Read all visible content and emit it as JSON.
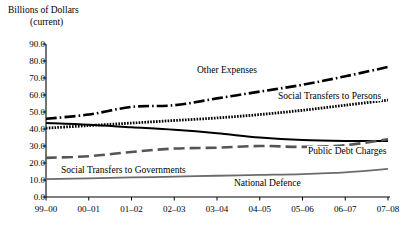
{
  "chart_data": {
    "type": "line",
    "title": "",
    "ylabel_lines": [
      "Billions of Dollars",
      "(current)"
    ],
    "ylabel": "Billions of Dollars (current)",
    "xlabel": "",
    "categories": [
      "99–00",
      "00–01",
      "01–02",
      "02–03",
      "03–04",
      "04–05",
      "05–06",
      "06–07",
      "07–08"
    ],
    "yticks": [
      "0.0",
      "10.0",
      "20.0",
      "30.0",
      "40.0",
      "50.0",
      "60.0",
      "70.0",
      "80.0",
      "90.0"
    ],
    "ylim": [
      0,
      90
    ],
    "grid": false,
    "legend_position": "inline-annotations",
    "series": [
      {
        "name": "Other Expenses",
        "style": "dash-dot",
        "color": "#000000",
        "label_x_category": "02–03",
        "values": [
          46.0,
          48.5,
          53.0,
          54.0,
          58.0,
          62.0,
          66.0,
          71.0,
          76.5
        ]
      },
      {
        "name": "Social Transfers to Persons",
        "style": "dotted-thick",
        "color": "#000000",
        "label_x_category": "05–06",
        "values": [
          40.5,
          42.0,
          43.5,
          45.0,
          46.5,
          48.5,
          51.0,
          54.0,
          57.0
        ]
      },
      {
        "name": "Public Debt Charges",
        "style": "solid",
        "color": "#000000",
        "label_x_category": "06–07",
        "values": [
          43.5,
          42.5,
          41.0,
          39.5,
          37.5,
          35.0,
          33.5,
          33.0,
          33.0
        ]
      },
      {
        "name": "Social Transfers to Governments",
        "style": "dashed",
        "color": "#555555",
        "label_x_category": "01–02",
        "values": [
          23.0,
          24.0,
          26.5,
          28.5,
          29.0,
          30.0,
          29.5,
          30.5,
          34.0
        ]
      },
      {
        "name": "National Defence",
        "style": "solid-gray",
        "color": "#6b6b6b",
        "label_x_category": "05–06",
        "values": [
          10.5,
          11.0,
          11.5,
          12.0,
          12.5,
          13.0,
          13.5,
          14.5,
          16.5
        ]
      }
    ]
  },
  "labels": {
    "other_expenses": "Other Expenses",
    "social_transfers_persons": "Social Transfers to Persons",
    "public_debt_charges": "Public Debt Charges",
    "social_transfers_governments": "Social Transfers to Governments",
    "national_defence": "National Defence"
  }
}
